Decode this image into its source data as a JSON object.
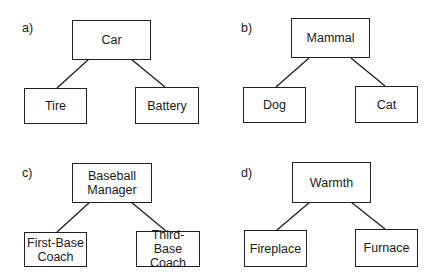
{
  "panels": [
    {
      "label": "a)",
      "parent": "Car",
      "children": [
        "Tire",
        "Battery"
      ]
    },
    {
      "label": "b)",
      "parent": "Mammal",
      "children": [
        "Dog",
        "Cat"
      ]
    },
    {
      "label": "c)",
      "parent": "Baseball Manager",
      "children": [
        "First-Base Coach",
        "Third-Base Coach"
      ]
    },
    {
      "label": "d)",
      "parent": "Warmth",
      "children": [
        "Fireplace",
        "Furnace"
      ]
    }
  ]
}
